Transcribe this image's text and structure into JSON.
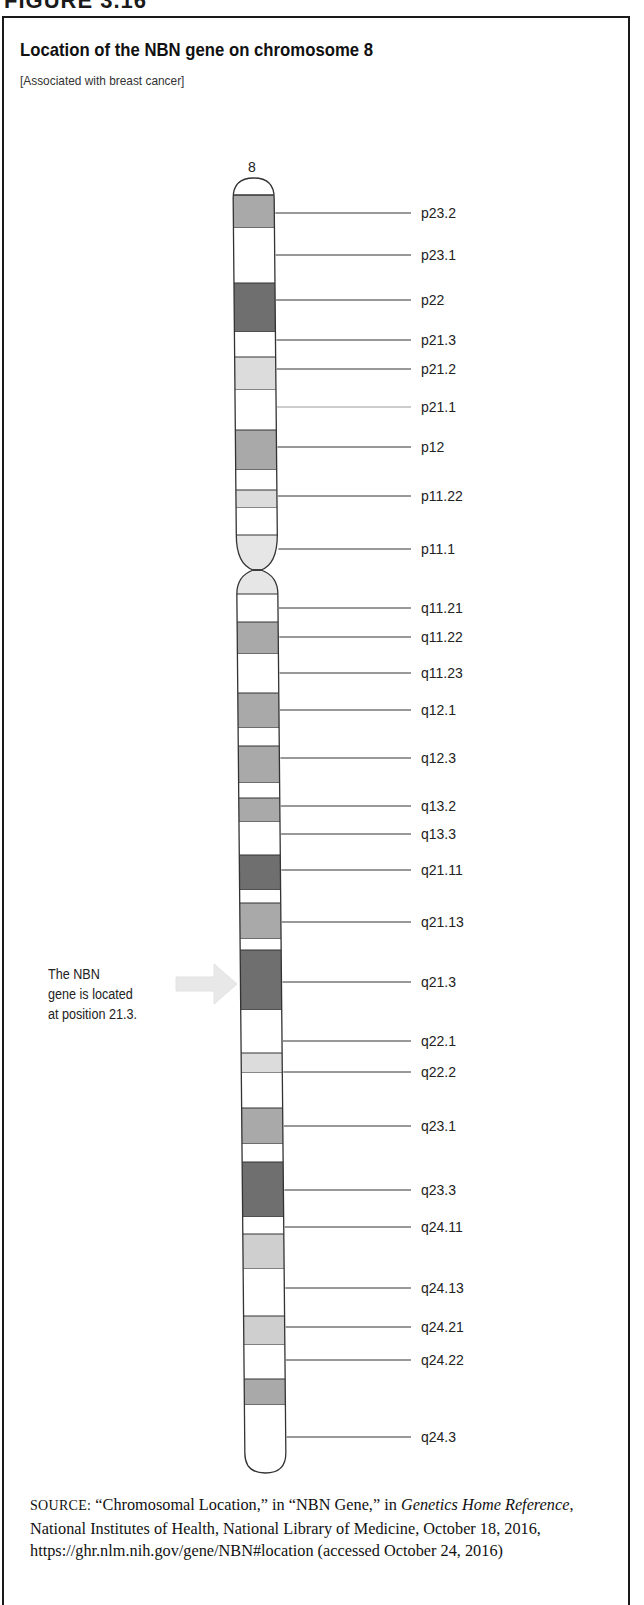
{
  "figure": {
    "label": "FIGURE 3.16",
    "title": "Location of the NBN gene on chromosome 8",
    "subtitle": "[Associated with breast cancer]"
  },
  "chart_data": {
    "type": "ideogram",
    "title": "Location of the NBN gene on chromosome 8",
    "subtitle": "[Associated with breast cancer]",
    "chromosome": "8",
    "annotation": {
      "text_lines": [
        "The NBN",
        "gene is located",
        "at position 21.3."
      ],
      "target_band": "q21.3"
    },
    "labels": [
      {
        "name": "p23.2",
        "y": 213
      },
      {
        "name": "p23.1",
        "y": 255
      },
      {
        "name": "p22",
        "y": 300
      },
      {
        "name": "p21.3",
        "y": 340
      },
      {
        "name": "p21.2",
        "y": 369
      },
      {
        "name": "p21.1",
        "y": 407
      },
      {
        "name": "p12",
        "y": 447
      },
      {
        "name": "p11.22",
        "y": 496
      },
      {
        "name": "p11.1",
        "y": 549
      },
      {
        "name": "q11.21",
        "y": 608
      },
      {
        "name": "q11.22",
        "y": 637
      },
      {
        "name": "q11.23",
        "y": 673
      },
      {
        "name": "q12.1",
        "y": 710
      },
      {
        "name": "q12.3",
        "y": 758
      },
      {
        "name": "q13.2",
        "y": 806
      },
      {
        "name": "q13.3",
        "y": 834
      },
      {
        "name": "q21.11",
        "y": 870
      },
      {
        "name": "q21.13",
        "y": 922
      },
      {
        "name": "q21.3",
        "y": 982
      },
      {
        "name": "q22.1",
        "y": 1041
      },
      {
        "name": "q22.2",
        "y": 1072
      },
      {
        "name": "q23.1",
        "y": 1126
      },
      {
        "name": "q23.3",
        "y": 1190
      },
      {
        "name": "q24.11",
        "y": 1227
      },
      {
        "name": "q24.13",
        "y": 1288
      },
      {
        "name": "q24.21",
        "y": 1327
      },
      {
        "name": "q24.22",
        "y": 1360
      },
      {
        "name": "q24.3",
        "y": 1437
      }
    ],
    "bands": [
      {
        "y0": 195,
        "y1": 228,
        "stain": "gpos50"
      },
      {
        "y0": 228,
        "y1": 283,
        "stain": "gneg"
      },
      {
        "y0": 283,
        "y1": 332,
        "stain": "gpos75"
      },
      {
        "y0": 332,
        "y1": 357,
        "stain": "gneg"
      },
      {
        "y0": 357,
        "y1": 390,
        "stain": "gpos25"
      },
      {
        "y0": 390,
        "y1": 430,
        "stain": "gneg"
      },
      {
        "y0": 430,
        "y1": 470,
        "stain": "gpos50"
      },
      {
        "y0": 470,
        "y1": 490,
        "stain": "gneg"
      },
      {
        "y0": 490,
        "y1": 508,
        "stain": "gpos25"
      },
      {
        "y0": 508,
        "y1": 535,
        "stain": "gneg"
      },
      {
        "y0": 594,
        "y1": 622,
        "stain": "gneg"
      },
      {
        "y0": 622,
        "y1": 654,
        "stain": "gpos50"
      },
      {
        "y0": 654,
        "y1": 693,
        "stain": "gneg"
      },
      {
        "y0": 693,
        "y1": 728,
        "stain": "gpos50"
      },
      {
        "y0": 728,
        "y1": 746,
        "stain": "gneg"
      },
      {
        "y0": 746,
        "y1": 783,
        "stain": "gpos50"
      },
      {
        "y0": 783,
        "y1": 798,
        "stain": "gneg"
      },
      {
        "y0": 798,
        "y1": 822,
        "stain": "gpos50"
      },
      {
        "y0": 822,
        "y1": 855,
        "stain": "gneg"
      },
      {
        "y0": 855,
        "y1": 890,
        "stain": "gpos75"
      },
      {
        "y0": 890,
        "y1": 903,
        "stain": "gneg"
      },
      {
        "y0": 903,
        "y1": 939,
        "stain": "gpos50"
      },
      {
        "y0": 939,
        "y1": 950,
        "stain": "gneg"
      },
      {
        "y0": 950,
        "y1": 1010,
        "stain": "gpos75"
      },
      {
        "y0": 1010,
        "y1": 1053,
        "stain": "gneg"
      },
      {
        "y0": 1053,
        "y1": 1073,
        "stain": "gpos25"
      },
      {
        "y0": 1073,
        "y1": 1108,
        "stain": "gneg"
      },
      {
        "y0": 1108,
        "y1": 1144,
        "stain": "gpos50"
      },
      {
        "y0": 1144,
        "y1": 1162,
        "stain": "gneg"
      },
      {
        "y0": 1162,
        "y1": 1217,
        "stain": "gpos75"
      },
      {
        "y0": 1217,
        "y1": 1234,
        "stain": "gneg"
      },
      {
        "y0": 1234,
        "y1": 1269,
        "stain": "gpos33"
      },
      {
        "y0": 1269,
        "y1": 1316,
        "stain": "gneg"
      },
      {
        "y0": 1316,
        "y1": 1345,
        "stain": "gpos33"
      },
      {
        "y0": 1345,
        "y1": 1379,
        "stain": "gneg"
      },
      {
        "y0": 1379,
        "y1": 1405,
        "stain": "gpos50"
      },
      {
        "y0": 1405,
        "y1": 1440,
        "stain": "gneg"
      }
    ],
    "centromere": {
      "p_end": 535,
      "pinch": 570,
      "q_start": 594
    },
    "stain_colors": {
      "gneg": "#ffffff",
      "gpos25": "#dcdcdc",
      "gpos33": "#cfcfcf",
      "gpos50": "#a9a9a9",
      "gpos75": "#6f6f6f",
      "acen": "#e6e6e6"
    }
  },
  "source": {
    "prefix": "SOURCE:",
    "part1": "“Chromosomal Location,” in “NBN Gene,” in ",
    "italic1": "Genetics Home Reference",
    "part2": ", National Institutes of Health, National Library of Medicine, October 18, 2016, https://ghr.nlm.nih.gov/gene/NBN#location (accessed October 24, 2016)"
  }
}
